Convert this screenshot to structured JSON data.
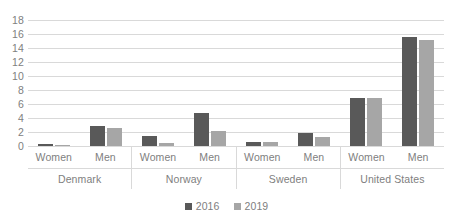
{
  "chart_data": {
    "type": "bar",
    "title": "",
    "xlabel": "",
    "ylabel": "",
    "ylim": [
      0,
      18
    ],
    "yticks": [
      18,
      16,
      14,
      12,
      10,
      8,
      6,
      4,
      2,
      0
    ],
    "grid": true,
    "legend_position": "bottom",
    "legend": [
      "2016",
      "2019"
    ],
    "categories": [
      "Denmark - Women",
      "Denmark - Men",
      "Norway - Women",
      "Norway - Men",
      "Sweden - Women",
      "Sweden - Men",
      "United States - Women",
      "United States - Men"
    ],
    "series": [
      {
        "name": "2016",
        "color": "#595959",
        "values": [
          0.25,
          2.8,
          1.5,
          4.7,
          0.6,
          1.8,
          6.85,
          15.6
        ]
      },
      {
        "name": "2019",
        "color": "#a6a6a6",
        "values": [
          0.05,
          2.55,
          0.45,
          2.1,
          0.6,
          1.25,
          6.9,
          15.2
        ]
      }
    ],
    "groups": [
      {
        "country": "Denmark",
        "subgroups": [
          {
            "label": "Women",
            "v2016": 0.25,
            "v2019": 0.05
          },
          {
            "label": "Men",
            "v2016": 2.8,
            "v2019": 2.55
          }
        ]
      },
      {
        "country": "Norway",
        "subgroups": [
          {
            "label": "Women",
            "v2016": 1.5,
            "v2019": 0.45
          },
          {
            "label": "Men",
            "v2016": 4.7,
            "v2019": 2.1
          }
        ]
      },
      {
        "country": "Sweden",
        "subgroups": [
          {
            "label": "Women",
            "v2016": 0.6,
            "v2019": 0.6
          },
          {
            "label": "Men",
            "v2016": 1.8,
            "v2019": 1.25
          }
        ]
      },
      {
        "country": "United States",
        "subgroups": [
          {
            "label": "Women",
            "v2016": 6.85,
            "v2019": 6.9
          },
          {
            "label": "Men",
            "v2016": 15.6,
            "v2019": 15.2
          }
        ]
      }
    ]
  },
  "colors": {
    "series_2016": "#595959",
    "series_2019": "#a6a6a6",
    "gridline": "#d9d9d9",
    "axis_text": "#808080",
    "background": "#ffffff"
  }
}
